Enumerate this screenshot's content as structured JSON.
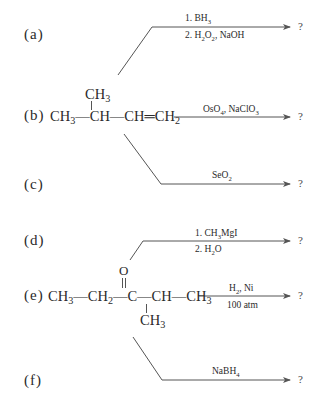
{
  "reactions": [
    {
      "label": "(a)",
      "reagent_line1": "1. BH",
      "reagent_line1_sub": "3",
      "reagent_line2_parts": [
        "2. H",
        "2",
        "O",
        "2",
        ", NaOH"
      ],
      "product": "?"
    },
    {
      "label": "(b)",
      "substrate": {
        "branch_top": "CH",
        "branch_top_sub": "3",
        "chain_parts": [
          "CH",
          "3",
          "—CH—CH═CH",
          "2"
        ]
      },
      "reagent_line1_parts": [
        "OsO",
        "4",
        ", NaClO",
        "3"
      ],
      "product": "?"
    },
    {
      "label": "(c)",
      "reagent_line1_parts": [
        "SeO",
        "2"
      ],
      "product": "?"
    },
    {
      "label": "(d)",
      "reagent_line1_parts": [
        "1. CH",
        "3",
        "MgI"
      ],
      "reagent_line2_parts": [
        "2. H",
        "2",
        "O"
      ],
      "product": "?"
    },
    {
      "label": "(e)",
      "substrate": {
        "carbonyl_oxygen": "O",
        "chain_parts": [
          "CH",
          "3",
          "—CH",
          "2",
          "—C—CH—CH",
          "3"
        ],
        "branch_bottom": "CH",
        "branch_bottom_sub": "3"
      },
      "reagent_line1_parts": [
        "H",
        "2",
        ", Ni"
      ],
      "reagent_line2": "100 atm",
      "product": "?"
    },
    {
      "label": "(f)",
      "reagent_line1_parts": [
        "NaBH",
        "4"
      ],
      "product": "?"
    }
  ]
}
